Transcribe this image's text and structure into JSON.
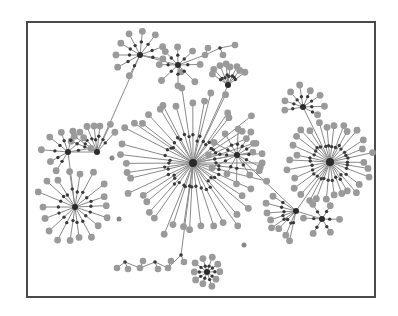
{
  "figure": {
    "type": "network-graph",
    "frame": {
      "x": 26,
      "y": 21,
      "width": 350,
      "height": 277
    },
    "colors": {
      "edge": "#8a8a8a",
      "leaf": "#9a9a9a",
      "intermediate": "#3a3a3a",
      "hub": "#2b2b2b",
      "border": "#4a4a4a"
    }
  },
  "graph": {
    "hubs": [
      {
        "id": "central",
        "x": 193,
        "y": 163,
        "leaves": 44,
        "r_in": 26,
        "r_out": 70,
        "start": 0,
        "span": 360
      },
      {
        "id": "right",
        "x": 330,
        "y": 162,
        "leaves": 30,
        "r_in": 18,
        "r_out": 40,
        "start": 0,
        "span": 360
      },
      {
        "id": "left-lower",
        "x": 75,
        "y": 207,
        "leaves": 18,
        "r_in": 16,
        "r_out": 36,
        "start": 0,
        "span": 360
      },
      {
        "id": "left-upper",
        "x": 97,
        "y": 152,
        "leaves": 8,
        "r_in": 14,
        "r_out": 28,
        "start": 200,
        "span": 110
      },
      {
        "id": "left-mid",
        "x": 68,
        "y": 152,
        "leaves": 8,
        "r_in": 12,
        "r_out": 24,
        "start": 120,
        "span": 230
      },
      {
        "id": "secondary",
        "x": 237,
        "y": 155,
        "leaves": 12,
        "r_in": 12,
        "r_out": 26,
        "start": 0,
        "span": 360
      },
      {
        "id": "top-left",
        "x": 140,
        "y": 55,
        "leaves": 9,
        "r_in": 12,
        "r_out": 26,
        "start": 120,
        "span": 250
      },
      {
        "id": "top-mid",
        "x": 178,
        "y": 65,
        "leaves": 8,
        "r_in": 10,
        "r_out": 22,
        "start": 0,
        "span": 360
      },
      {
        "id": "top-right",
        "x": 228,
        "y": 85,
        "leaves": 8,
        "r_in": 9,
        "r_out": 20,
        "start": 215,
        "span": 110
      },
      {
        "id": "right-top",
        "x": 303,
        "y": 107,
        "leaves": 8,
        "r_in": 10,
        "r_out": 20,
        "start": 170,
        "span": 220
      },
      {
        "id": "bottom-right-a",
        "x": 296,
        "y": 211,
        "leaves": 8,
        "r_in": 14,
        "r_out": 30,
        "start": 100,
        "span": 110
      },
      {
        "id": "bottom-right-b",
        "x": 322,
        "y": 219,
        "leaves": 6,
        "r_in": 9,
        "r_out": 17,
        "start": 0,
        "span": 360
      },
      {
        "id": "bottom-cluster",
        "x": 207,
        "y": 272,
        "leaves": 10,
        "r_in": 7,
        "r_out": 14,
        "start": 0,
        "span": 360
      }
    ],
    "links": [
      [
        "left-upper",
        "top-left"
      ],
      [
        "left-upper",
        "left-mid"
      ],
      [
        "left-mid",
        "left-lower"
      ],
      [
        "top-left",
        "top-mid"
      ],
      [
        "central",
        "top-right"
      ],
      [
        "central",
        "secondary"
      ],
      [
        "secondary",
        "bottom-right-a"
      ],
      [
        "bottom-right-a",
        "right"
      ],
      [
        "right",
        "right-top"
      ],
      [
        "bottom-right-a",
        "bottom-right-b"
      ],
      [
        "central",
        "bottom-chain-end"
      ]
    ],
    "chains": [
      {
        "id": "bottom-chain",
        "points": [
          [
            181,
            255
          ],
          [
            168,
            268
          ],
          [
            155,
            262
          ],
          [
            140,
            268
          ],
          [
            125,
            262
          ],
          [
            117,
            268
          ]
        ]
      },
      {
        "id": "top-chain",
        "points": [
          [
            178,
            65
          ],
          [
            205,
            55
          ],
          [
            220,
            48
          ],
          [
            235,
            45
          ]
        ]
      }
    ],
    "stray_nodes": [
      [
        112,
        158
      ],
      [
        244,
        245
      ],
      [
        119,
        219
      ]
    ]
  }
}
